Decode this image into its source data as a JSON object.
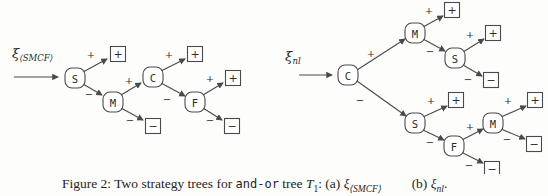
{
  "caption": {
    "text_before_code": "Figure 2: Two strategy trees for ",
    "code_text": "and-or",
    "text_after_code": " tree ",
    "tree_symbol": "T",
    "tree_symbol_sub": "1",
    "separator": ": (a) ",
    "xi_a": "ξ",
    "xi_a_sub": "⟨SMCF⟩",
    "b_label": "(b) ",
    "xi_b": "ξ",
    "xi_b_sub": "nl",
    "period": "."
  },
  "diagram": {
    "line_color": "#4a4a4a",
    "text_color": "#2b2b2b",
    "trees": [
      {
        "id": "a",
        "strategy_label": {
          "symbol": "ξ",
          "sub": "⟨SMCF⟩",
          "x": 12,
          "y": 58
        },
        "entry_arrow": {
          "x1": 14,
          "y1": 77,
          "x2": 58,
          "y2": 77
        },
        "nodes": [
          {
            "label": "S",
            "x": 75,
            "y": 78
          },
          {
            "label": "M",
            "x": 113,
            "y": 102
          },
          {
            "label": "C",
            "x": 153,
            "y": 77
          },
          {
            "label": "F",
            "x": 195,
            "y": 102
          }
        ],
        "leaves": [
          {
            "sign": "+",
            "x": 118,
            "y": 54
          },
          {
            "sign": "−",
            "x": 153,
            "y": 126
          },
          {
            "sign": "+",
            "x": 195,
            "y": 54
          },
          {
            "sign": "+",
            "x": 233,
            "y": 78
          },
          {
            "sign": "−",
            "x": 232,
            "y": 126
          }
        ],
        "edges": [
          {
            "x1": 83,
            "y1": 72,
            "x2": 107,
            "y2": 59,
            "sign": "+",
            "sx": 91,
            "sy": 54
          },
          {
            "x1": 83,
            "y1": 84,
            "x2": 102,
            "y2": 95,
            "sign": "−",
            "sx": 89,
            "sy": 94
          },
          {
            "x1": 121,
            "y1": 95,
            "x2": 141,
            "y2": 83,
            "sign": "+",
            "sx": 129,
            "sy": 80
          },
          {
            "x1": 121,
            "y1": 108,
            "x2": 143,
            "y2": 120,
            "sign": "−",
            "sx": 130,
            "sy": 120
          },
          {
            "x1": 161,
            "y1": 71,
            "x2": 185,
            "y2": 59,
            "sign": "+",
            "sx": 169,
            "sy": 54
          },
          {
            "x1": 161,
            "y1": 83,
            "x2": 185,
            "y2": 96,
            "sign": "−",
            "sx": 167,
            "sy": 99
          },
          {
            "x1": 203,
            "y1": 95,
            "x2": 223,
            "y2": 83,
            "sign": "+",
            "sx": 210,
            "sy": 78
          },
          {
            "x1": 203,
            "y1": 108,
            "x2": 222,
            "y2": 120,
            "sign": "−",
            "sx": 210,
            "sy": 120
          }
        ]
      },
      {
        "id": "b",
        "strategy_label": {
          "symbol": "ξ",
          "sub": "nl",
          "x": 285,
          "y": 61
        },
        "entry_arrow": {
          "x1": 299,
          "y1": 75,
          "x2": 332,
          "y2": 75
        },
        "nodes": [
          {
            "label": "C",
            "x": 348,
            "y": 75
          },
          {
            "label": "M",
            "x": 415,
            "y": 33
          },
          {
            "label": "S",
            "x": 455,
            "y": 58
          },
          {
            "label": "S",
            "x": 415,
            "y": 123
          },
          {
            "label": "F",
            "x": 454,
            "y": 146
          },
          {
            "label": "M",
            "x": 493,
            "y": 123
          }
        ],
        "leaves": [
          {
            "sign": "+",
            "x": 452,
            "y": 10
          },
          {
            "sign": "+",
            "x": 493,
            "y": 33
          },
          {
            "sign": "−",
            "x": 491,
            "y": 80
          },
          {
            "sign": "+",
            "x": 456,
            "y": 100
          },
          {
            "sign": "−",
            "x": 492,
            "y": 169
          },
          {
            "sign": "+",
            "x": 535,
            "y": 100
          },
          {
            "sign": "−",
            "x": 534,
            "y": 144
          }
        ],
        "edges": [
          {
            "x1": 357,
            "y1": 70,
            "x2": 405,
            "y2": 39,
            "sign": "+",
            "sx": 371,
            "sy": 53
          },
          {
            "x1": 357,
            "y1": 81,
            "x2": 406,
            "y2": 116,
            "sign": "−",
            "sx": 360,
            "sy": 100
          },
          {
            "x1": 423,
            "y1": 27,
            "x2": 443,
            "y2": 16,
            "sign": "+",
            "sx": 429,
            "sy": 10
          },
          {
            "x1": 423,
            "y1": 39,
            "x2": 445,
            "y2": 51,
            "sign": "−",
            "sx": 430,
            "sy": 51
          },
          {
            "x1": 463,
            "y1": 52,
            "x2": 484,
            "y2": 39,
            "sign": "+",
            "sx": 470,
            "sy": 34
          },
          {
            "x1": 463,
            "y1": 65,
            "x2": 482,
            "y2": 76,
            "sign": "−",
            "sx": 468,
            "sy": 79
          },
          {
            "x1": 423,
            "y1": 117,
            "x2": 447,
            "y2": 106,
            "sign": "+",
            "sx": 431,
            "sy": 100
          },
          {
            "x1": 423,
            "y1": 130,
            "x2": 444,
            "y2": 140,
            "sign": "−",
            "sx": 430,
            "sy": 142
          },
          {
            "x1": 462,
            "y1": 140,
            "x2": 483,
            "y2": 129,
            "sign": "+",
            "sx": 470,
            "sy": 126
          },
          {
            "x1": 461,
            "y1": 152,
            "x2": 483,
            "y2": 163,
            "sign": "−",
            "sx": 469,
            "sy": 165
          },
          {
            "x1": 501,
            "y1": 117,
            "x2": 526,
            "y2": 106,
            "sign": "+",
            "sx": 508,
            "sy": 100
          },
          {
            "x1": 501,
            "y1": 129,
            "x2": 525,
            "y2": 139,
            "sign": "−",
            "sx": 507,
            "sy": 139
          }
        ]
      }
    ]
  }
}
